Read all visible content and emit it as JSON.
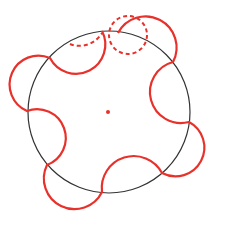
{
  "diagram": {
    "type": "geometric-construction",
    "colors": {
      "base_circle": "#333333",
      "curve": "#e8312a",
      "background": "#ffffff"
    },
    "base_circle": {
      "cx": 109,
      "cy": 112,
      "r": 81
    },
    "center_point": {
      "cx": 108,
      "cy": 112,
      "r": 2
    },
    "dashed_circle": {
      "cx": 128,
      "cy": 35,
      "r": 19
    }
  }
}
